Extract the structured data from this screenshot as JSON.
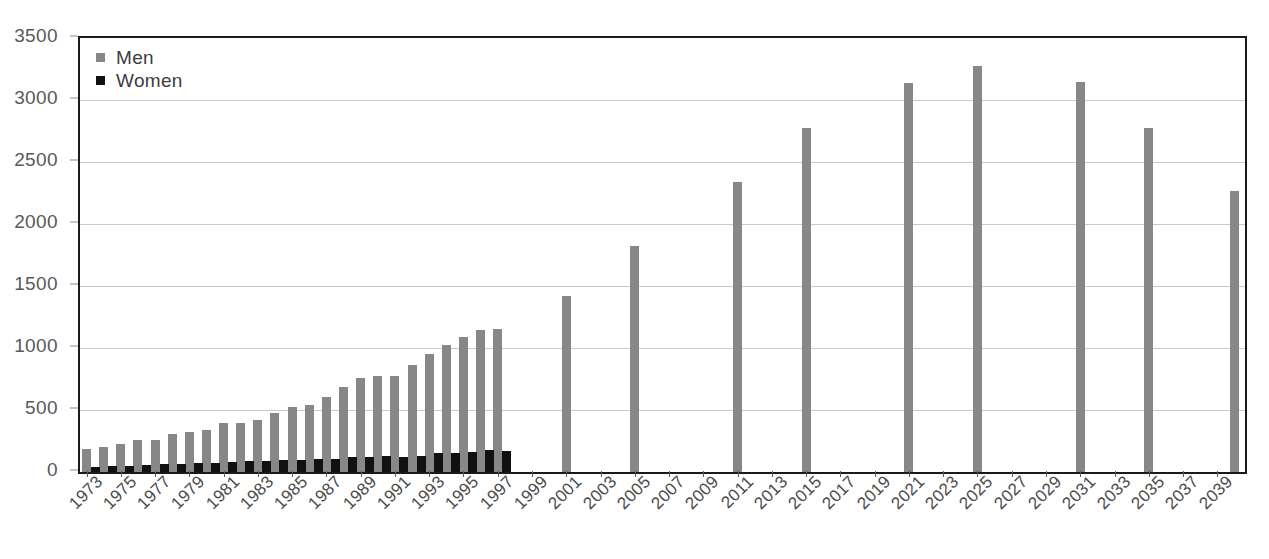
{
  "chart_data": {
    "type": "bar",
    "title": "",
    "subtitle": "",
    "xlabel": "",
    "ylabel": "",
    "ylim": [
      0,
      3500
    ],
    "y_ticks": [
      0,
      500,
      1000,
      1500,
      2000,
      2500,
      3000,
      3500
    ],
    "y_tick_labels": [
      "0",
      "500",
      "1000",
      "1500",
      "2000",
      "2500",
      "3000",
      "3500"
    ],
    "grid": true,
    "legend_position": "top-left",
    "legend": [
      "Men",
      "Women"
    ],
    "colors": {
      "men": "#878787",
      "women": "#111111",
      "axis": "#1a1a1a",
      "grid": "#c9c9c9",
      "text": "#4a4a4a"
    },
    "x_range": [
      1973,
      2040
    ],
    "x_tick_labels": [
      "1973",
      "1975",
      "1977",
      "1979",
      "1981",
      "1983",
      "1985",
      "1987",
      "1989",
      "1991",
      "1993",
      "1995",
      "1997",
      "1999",
      "2001",
      "2003",
      "2005",
      "2007",
      "2009",
      "2011",
      "2013",
      "2015",
      "2017",
      "2019",
      "2021",
      "2023",
      "2025",
      "2027",
      "2029",
      "2031",
      "2033",
      "2035",
      "2037",
      "2039"
    ],
    "series": [
      {
        "name": "Men",
        "points": [
          {
            "x": 1973,
            "y": 185
          },
          {
            "x": 1974,
            "y": 205
          },
          {
            "x": 1975,
            "y": 225
          },
          {
            "x": 1976,
            "y": 255
          },
          {
            "x": 1977,
            "y": 262
          },
          {
            "x": 1978,
            "y": 310
          },
          {
            "x": 1979,
            "y": 325
          },
          {
            "x": 1980,
            "y": 340
          },
          {
            "x": 1981,
            "y": 392
          },
          {
            "x": 1982,
            "y": 398
          },
          {
            "x": 1983,
            "y": 418
          },
          {
            "x": 1984,
            "y": 478
          },
          {
            "x": 1985,
            "y": 522
          },
          {
            "x": 1986,
            "y": 540
          },
          {
            "x": 1987,
            "y": 605
          },
          {
            "x": 1988,
            "y": 688
          },
          {
            "x": 1989,
            "y": 760
          },
          {
            "x": 1990,
            "y": 772
          },
          {
            "x": 1991,
            "y": 775
          },
          {
            "x": 1992,
            "y": 862
          },
          {
            "x": 1993,
            "y": 952
          },
          {
            "x": 1994,
            "y": 1022
          },
          {
            "x": 1995,
            "y": 1092
          },
          {
            "x": 1996,
            "y": 1145
          },
          {
            "x": 1997,
            "y": 1150
          },
          {
            "x": 2001,
            "y": 1420
          },
          {
            "x": 2005,
            "y": 1820
          },
          {
            "x": 2011,
            "y": 2335
          },
          {
            "x": 2015,
            "y": 2772
          },
          {
            "x": 2021,
            "y": 3140
          },
          {
            "x": 2025,
            "y": 3272
          },
          {
            "x": 2031,
            "y": 3142
          },
          {
            "x": 2035,
            "y": 2778
          },
          {
            "x": 2040,
            "y": 2265
          }
        ]
      },
      {
        "name": "Women",
        "points": [
          {
            "x": 1973,
            "y": 42
          },
          {
            "x": 1974,
            "y": 50
          },
          {
            "x": 1975,
            "y": 52
          },
          {
            "x": 1976,
            "y": 58
          },
          {
            "x": 1977,
            "y": 62
          },
          {
            "x": 1978,
            "y": 68
          },
          {
            "x": 1979,
            "y": 72
          },
          {
            "x": 1980,
            "y": 75
          },
          {
            "x": 1981,
            "y": 82
          },
          {
            "x": 1982,
            "y": 86
          },
          {
            "x": 1983,
            "y": 88
          },
          {
            "x": 1984,
            "y": 95
          },
          {
            "x": 1985,
            "y": 98
          },
          {
            "x": 1986,
            "y": 102
          },
          {
            "x": 1987,
            "y": 108
          },
          {
            "x": 1988,
            "y": 118
          },
          {
            "x": 1989,
            "y": 125
          },
          {
            "x": 1990,
            "y": 128
          },
          {
            "x": 1991,
            "y": 122
          },
          {
            "x": 1992,
            "y": 132
          },
          {
            "x": 1993,
            "y": 152
          },
          {
            "x": 1994,
            "y": 152
          },
          {
            "x": 1995,
            "y": 158
          },
          {
            "x": 1996,
            "y": 178
          },
          {
            "x": 1997,
            "y": 172
          }
        ]
      }
    ]
  },
  "legend": {
    "men_label": "Men",
    "women_label": "Women"
  }
}
